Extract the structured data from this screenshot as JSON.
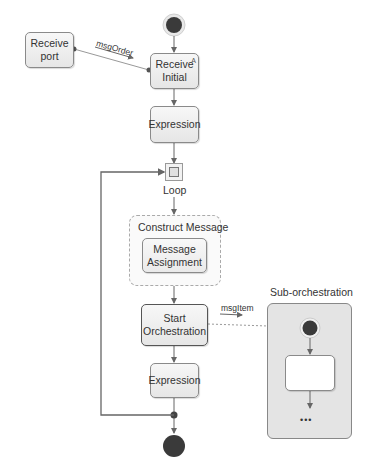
{
  "diagram": {
    "type": "orchestration-flow",
    "nodes": {
      "receive_port": "Receive\nport",
      "receive_port_line1": "Receive",
      "receive_port_line2": "port",
      "receive_initial_line1": "Receive",
      "receive_initial_line2": "Initial",
      "receive_initial_marker": "A",
      "expression_1": "Expression",
      "loop": "Loop",
      "construct_message": "Construct Message",
      "message_assignment_line1": "Message",
      "message_assignment_line2": "Assignment",
      "start_orchestration_line1": "Start",
      "start_orchestration_line2": "Orchestration",
      "expression_2": "Expression",
      "sub_orchestration": "Sub-orchestration",
      "sub_ellipsis": "•••"
    },
    "edges": {
      "msg_order": "msgOrder",
      "msg_item": "msgItem"
    },
    "colors": {
      "line": "#666666",
      "start_end_fill": "#3a3a3a",
      "node_border": "#8a8a8a",
      "sub_box_fill": "#e4e4e4"
    }
  }
}
